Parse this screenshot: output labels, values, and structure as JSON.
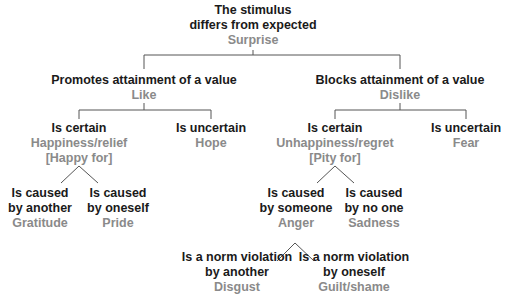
{
  "diagram": {
    "colors": {
      "condition_text": "#1a1a1a",
      "emotion_text": "#8a8a8a",
      "lines": "#555555",
      "background": "#ffffff"
    },
    "root": {
      "line1": "The stimulus",
      "line2": "differs from expected",
      "emotion": "Surprise"
    },
    "promotes": {
      "label": "Promotes attainment of a value",
      "emotion": "Like"
    },
    "blocks": {
      "label": "Blocks attainment of a value",
      "emotion": "Dislike"
    },
    "promotes_certain": {
      "label": "Is certain",
      "emotion": "Happiness/relief",
      "emotion2": "[Happy for]"
    },
    "promotes_uncertain": {
      "label": "Is uncertain",
      "emotion": "Hope"
    },
    "blocks_certain": {
      "label": "Is certain",
      "emotion": "Unhappiness/regret",
      "emotion2": "[Pity for]"
    },
    "blocks_uncertain": {
      "label": "Is uncertain",
      "emotion": "Fear"
    },
    "caused_another": {
      "line1": "Is caused",
      "line2": "by another",
      "emotion": "Gratitude"
    },
    "caused_oneself": {
      "line1": "Is caused",
      "line2": "by oneself",
      "emotion": "Pride"
    },
    "caused_someone": {
      "line1": "Is caused",
      "line2": "by someone",
      "emotion": "Anger"
    },
    "caused_noone": {
      "line1": "Is caused",
      "line2": "by no one",
      "emotion": "Sadness"
    },
    "norm_another": {
      "line1": "Is a norm violation",
      "line2": "by another",
      "emotion": "Disgust"
    },
    "norm_oneself": {
      "line1": "Is a norm violation",
      "line2": "by oneself",
      "emotion": "Guilt/shame"
    }
  }
}
